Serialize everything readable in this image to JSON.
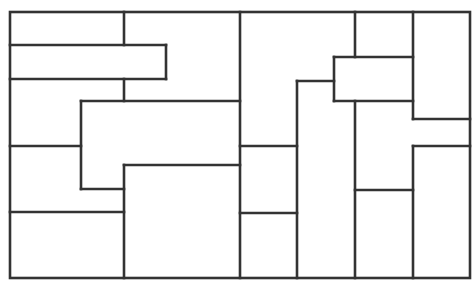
{
  "diagram": {
    "type": "rectangular-partition",
    "stroke_color": "#333333",
    "stroke_width": 2.6,
    "background": "#ffffff",
    "outer_border": {
      "x": 10,
      "y": 12,
      "width": 460,
      "height": 266
    },
    "segments": [
      [
        124,
        12,
        124,
        45
      ],
      [
        10,
        45,
        166,
        45
      ],
      [
        166,
        45,
        166,
        79
      ],
      [
        10,
        79,
        166,
        79
      ],
      [
        124,
        79,
        124,
        101
      ],
      [
        81,
        101,
        240,
        101
      ],
      [
        81,
        101,
        81,
        189
      ],
      [
        10,
        146,
        81,
        146
      ],
      [
        81,
        189,
        124,
        189
      ],
      [
        124,
        165,
        240,
        165
      ],
      [
        124,
        165,
        124,
        278
      ],
      [
        10,
        212,
        124,
        212
      ],
      [
        240,
        12,
        240,
        278
      ],
      [
        240,
        146,
        297,
        146
      ],
      [
        240,
        213,
        297,
        213
      ],
      [
        297,
        81,
        297,
        278
      ],
      [
        297,
        81,
        334,
        81
      ],
      [
        334,
        57,
        334,
        101
      ],
      [
        334,
        57,
        413,
        57
      ],
      [
        334,
        101,
        413,
        101
      ],
      [
        355,
        12,
        355,
        57
      ],
      [
        355,
        101,
        355,
        278
      ],
      [
        413,
        12,
        413,
        119
      ],
      [
        413,
        119,
        470,
        119
      ],
      [
        413,
        146,
        470,
        146
      ],
      [
        413,
        146,
        413,
        278
      ],
      [
        355,
        190,
        413,
        190
      ]
    ]
  }
}
